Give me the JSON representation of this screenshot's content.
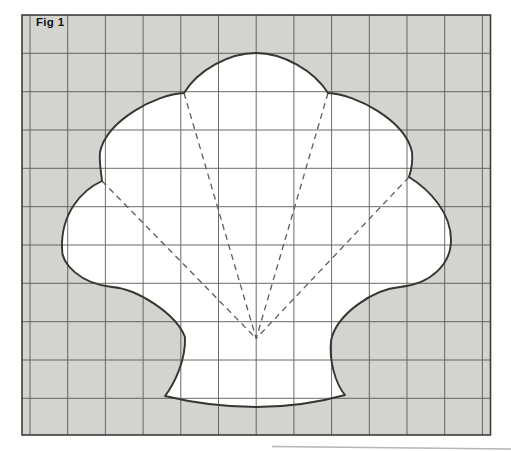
{
  "figure": {
    "label": "Fig 1",
    "type": "grid-outline-diagram",
    "colors": {
      "page_bg": "#ffffff",
      "outside_fill": "#d3d3d0",
      "inside_fill": "#ffffff",
      "grid_line": "#54524c",
      "frame": "#3f3d39",
      "outline": "#37352f",
      "dashed_line": "#5f5d57",
      "label": "#141414",
      "page_edge": "#b6b6b2"
    },
    "grid": {
      "x": 22,
      "y": 15,
      "width": 468.5,
      "height": 420,
      "cell_size": 38.3,
      "line_width": 1,
      "line_opacity": 0.85,
      "frame_width": 1.6,
      "vlines": [
        30,
        67.7,
        105.4,
        143.1,
        180.8,
        218.5,
        256.2,
        293.9,
        331.6,
        369.3,
        407,
        444.7,
        482.4
      ],
      "hlines": [
        53.3,
        91.7,
        130,
        168.3,
        206.7,
        245,
        283.3,
        321.7,
        360,
        398.3
      ]
    },
    "shell": {
      "stroke_width": 1.9,
      "apex": [
        256,
        53
      ],
      "notches": {
        "top_left": [
          184,
          93
        ],
        "top_right": [
          328,
          93
        ],
        "mid_left": [
          102,
          181
        ],
        "mid_right": [
          409,
          177
        ]
      },
      "base_points": {
        "waist_left": [
          185,
          337
        ],
        "waist_right": [
          331,
          341
        ],
        "bottom_left": [
          165,
          396
        ],
        "bottom_right": [
          345,
          395
        ],
        "bottom_mid": [
          256,
          407
        ]
      },
      "path": "M 256 53 C 283 53 314 70.5 328 93 C 355 94 405 120 412 152 C 413 162 411 171 409 177 C 430 190 451 213 451 240 C 451 264 431 284 400 287 C 374 289 336 314 331 341 C 329 360 335 383 345 395 C 313 404 284 407 256 407 C 228 407 198 404 165 396 C 175 383 186 359 185 337 C 176 314 138 289 112 287 C 81 284 61 264 62 248 C 61 213 82 190 102 181 C 101 171 99 162 100 152 C 107 120 157 94 184 93 C 198 70 229 53 256 53 Z"
    },
    "dashed": {
      "origin": [
        256.2,
        338.5
      ],
      "targets": [
        [
          184,
          93
        ],
        [
          328,
          93
        ],
        [
          102,
          181
        ],
        [
          409,
          177
        ]
      ],
      "width": 1.3,
      "pattern": "6 4.5"
    },
    "page_edge": {
      "x1": 272,
      "y1": 446.5,
      "x2": 511,
      "y2": 449,
      "width": 1.6
    }
  }
}
